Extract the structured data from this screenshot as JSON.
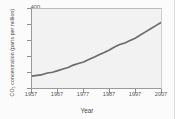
{
  "chart_data": {
    "type": "line",
    "title": "",
    "xlabel": "Year",
    "ylabel": "CO2 concentration (parts per million)",
    "ylabel_display": "CO₂ concentration (parts per million)",
    "xlim": [
      1957,
      2007
    ],
    "ylim": [
      300,
      400
    ],
    "yticks": [
      300,
      320,
      340,
      360,
      380,
      400
    ],
    "xticks": [
      1957,
      1967,
      1977,
      1987,
      1997,
      2007
    ],
    "grid": false,
    "legend": "none",
    "line_color": "#6b6b6b",
    "plot_background": "#f2f2f2",
    "figure_background": "#fbfbfb",
    "series": [
      {
        "name": "Atmospheric CO2",
        "x": [
          1957,
          1959,
          1961,
          1963,
          1965,
          1967,
          1969,
          1971,
          1973,
          1975,
          1977,
          1979,
          1981,
          1983,
          1985,
          1987,
          1989,
          1991,
          1993,
          1995,
          1997,
          1999,
          2001,
          2003,
          2005,
          2007
        ],
        "values": [
          315,
          316,
          317,
          319,
          320,
          322,
          324,
          326,
          329,
          331,
          333,
          336,
          339,
          342,
          345,
          348,
          352,
          355,
          357,
          360,
          363,
          367,
          371,
          375,
          379,
          383
        ]
      }
    ]
  },
  "axes": {
    "ytick_labels": [
      "400",
      "380",
      "360",
      "340",
      "320",
      "300"
    ],
    "xtick_labels": [
      "1957",
      "1967",
      "1977",
      "1987",
      "1997",
      "2007"
    ]
  }
}
